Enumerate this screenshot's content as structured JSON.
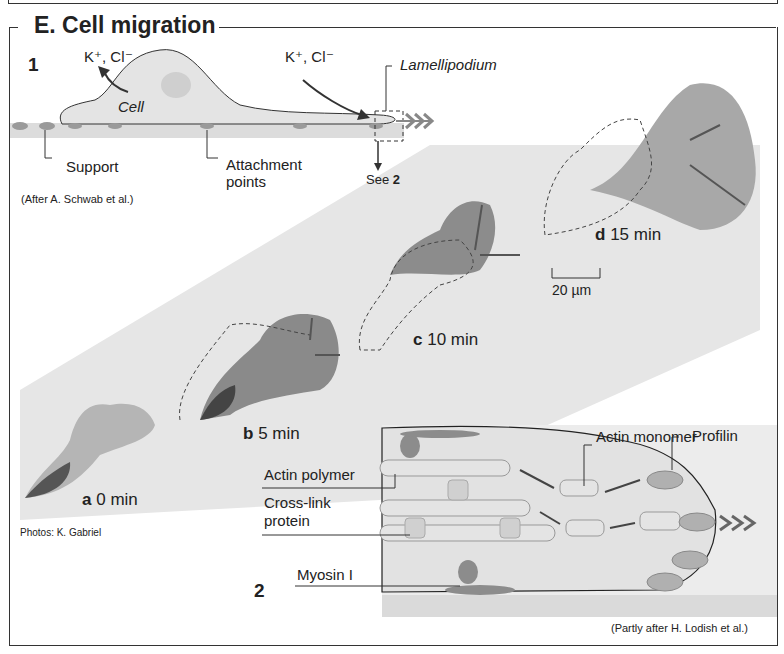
{
  "figure": {
    "title": "E. Cell migration",
    "panel1": {
      "number": "1",
      "ions_left": "K⁺, Cl⁻",
      "ions_right": "K⁺, Cl⁻",
      "cell_label": "Cell",
      "lamellipodium_label": "Lamellipodium",
      "support_label": "Support",
      "attachment_label_1": "Attachment",
      "attachment_label_2": "points",
      "see_label": "See",
      "see_ref": "2",
      "credit": "(After A. Schwab et al.)"
    },
    "photos": {
      "frames": [
        {
          "letter": "a",
          "time": "0 min"
        },
        {
          "letter": "b",
          "time": "5 min"
        },
        {
          "letter": "c",
          "time": "10 min"
        },
        {
          "letter": "d",
          "time": "15 min"
        }
      ],
      "scale_bar": "20 µm",
      "credit": "Photos: K. Gabriel"
    },
    "panel2": {
      "number": "2",
      "labels": {
        "actin_monomer": "Actin monomer",
        "profilin": "Profilin",
        "actin_polymer": "Actin polymer",
        "crosslink_1": "Cross-link",
        "crosslink_2": "protein",
        "myosin": "Myosin I"
      },
      "credit": "(Partly after H. Lodish et al.)"
    },
    "colors": {
      "cell_fill": "#e4e4e4",
      "support": "#d8d8d8",
      "photo_band": "#e6e6e6",
      "attachment": "#9a9a9a",
      "line": "#333333"
    }
  }
}
